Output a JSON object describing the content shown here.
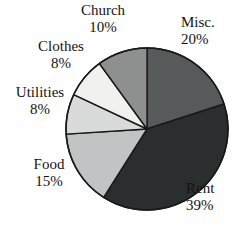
{
  "chart_data": {
    "type": "pie",
    "title": "",
    "xlabel": "",
    "ylabel": "",
    "legend_position": "none",
    "grid": false,
    "units": "percent",
    "total": 100,
    "start_angle_deg": 0,
    "direction": "clockwise",
    "categories": [
      "Misc.",
      "Rent",
      "Food",
      "Utilities",
      "Clothes",
      "Church"
    ],
    "values": [
      20,
      39,
      15,
      8,
      8,
      10
    ],
    "labels": [
      "20%",
      "39%",
      "15%",
      "8%",
      "8%",
      "10%"
    ],
    "slices": [
      {
        "name": "Misc.",
        "value": 20,
        "label": "20%",
        "color": "#565a5a",
        "start_deg": 0,
        "end_deg": 72
      },
      {
        "name": "Rent",
        "value": 39,
        "label": "39%",
        "color": "#2b2e2f",
        "start_deg": 72,
        "end_deg": 212.4
      },
      {
        "name": "Food",
        "value": 15,
        "label": "15%",
        "color": "#c1c4c4",
        "start_deg": 212.4,
        "end_deg": 266.4
      },
      {
        "name": "Utilities",
        "value": 8,
        "label": "8%",
        "color": "#d9dbdb",
        "start_deg": 266.4,
        "end_deg": 295.2
      },
      {
        "name": "Clothes",
        "value": 8,
        "label": "8%",
        "color": "#f1f1f0",
        "start_deg": 295.2,
        "end_deg": 324
      },
      {
        "name": "Church",
        "value": 10,
        "label": "10%",
        "color": "#8e9090",
        "start_deg": 324,
        "end_deg": 360
      }
    ],
    "geometry": {
      "cx": 147,
      "cy": 129,
      "r": 81
    },
    "stroke_color": "#1a1a1a",
    "background_color": "#ffffff"
  }
}
